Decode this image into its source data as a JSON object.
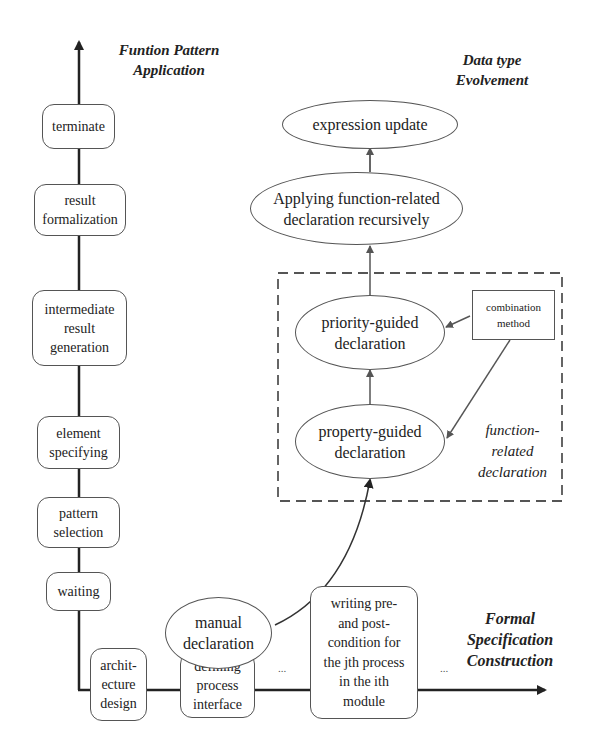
{
  "axes": {
    "vertical_title": "Funtion Pattern\nApplication",
    "horizontal_title": "Formal\nSpecification\nConstruction",
    "data_type_title": "Data type\nEvolvement"
  },
  "vertical_steps": [
    {
      "label": "terminate"
    },
    {
      "label": "result\nformalization"
    },
    {
      "label": "intermediate\nresult\ngeneration"
    },
    {
      "label": "element\nspecifying"
    },
    {
      "label": "pattern\nselection"
    },
    {
      "label": "waiting"
    }
  ],
  "horizontal_steps": [
    {
      "label": "archit-\necture\ndesign"
    },
    {
      "label": "defining\nprocess\ninterface"
    },
    {
      "label": "..."
    },
    {
      "label": "writing pre-\nand post-\ncondition for\nthe jth process\nin the ith\nmodule"
    },
    {
      "label": "..."
    }
  ],
  "data_type_nodes": {
    "expression_update": "expression update",
    "applying": "Applying function-related\ndeclaration recursively",
    "priority": "priority-guided\ndeclaration",
    "property": "property-guided\ndeclaration",
    "combination": "combination\nmethod",
    "manual": "manual\ndeclaration",
    "group_label": "function-\nrelated\ndeclaration"
  }
}
